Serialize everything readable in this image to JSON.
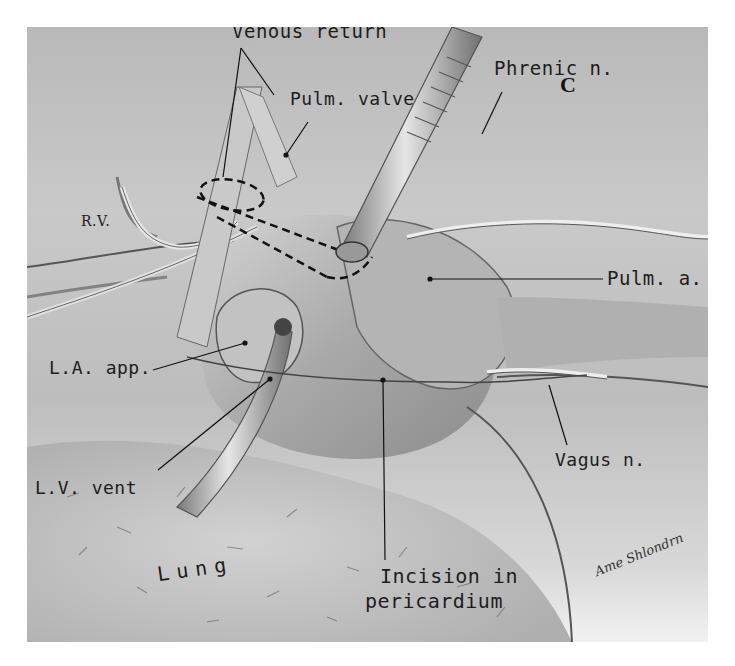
{
  "figure": {
    "panel_letter": "C",
    "signature": "Ame Shlondrn"
  },
  "labels": {
    "venous_return": "Venous return",
    "pulm_valve": "Pulm. valve",
    "phrenic_n": "Phrenic n.",
    "rv": "R.V.",
    "pulm_a": "Pulm. a.",
    "la_app": "L.A. app.",
    "vagus_n": "Vagus n.",
    "lv_vent": "L.V. vent",
    "lung": "Lung",
    "incision_line1": "Incision in",
    "incision_line2": "pericardium"
  },
  "colors": {
    "background": "#ffffff",
    "tissue_mid": "#bdbdbd",
    "ink": "#1d1d1d"
  }
}
